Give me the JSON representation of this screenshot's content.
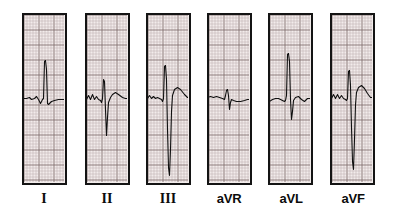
{
  "figure": {
    "background_color": "#ffffff",
    "width": 401,
    "height": 214
  },
  "grid": {
    "paper_color": "#f2eceb",
    "minor_line_color": "#b9aaa8",
    "major_line_color": "#7d6c6a",
    "border_color": "#141414",
    "minor_spacing_px": 3,
    "major_every": 5
  },
  "trace": {
    "color": "#101010",
    "line_width": 1.1,
    "baseline_y": 98
  },
  "chart_data": {
    "type": "line",
    "xlabel": "",
    "ylabel": "",
    "grid": true,
    "legend_position": "below-each-panel",
    "panel_count": 6,
    "panels": [
      {
        "label": "I",
        "label_style": "roman",
        "x": 22,
        "y": 13,
        "width": 45,
        "height": 172,
        "baseline_y": 98,
        "qrs": {
          "r_peak_y": 61,
          "r_amplitude_mm": 12.3,
          "s_depth_mm": 1.6,
          "description": "tall upright R wave, small s, flat baseline"
        },
        "points": "2,99 5,99 8,98 10,100 13,99 15,97 17,100 19,104 21,100 22,99 23,62 24,61 25,70 26,104 27,105 28,104 30,102 33,101 37,100 41,100 44,100"
      },
      {
        "label": "II",
        "label_style": "roman",
        "x": 85,
        "y": 13,
        "width": 45,
        "height": 172,
        "baseline_y": 98,
        "qrs": {
          "r_peak_y": 80,
          "r_amplitude_mm": 6.0,
          "s_depth_mm": 12.3,
          "description": "small R wave followed by deep S wave"
        },
        "points": "2,100 4,96 6,100 8,95 10,100 12,97 14,100 16,101 17,103 18,99 19,80 20,82 21,110 22,136 23,118 24,103 26,98 28,95 31,93 34,95 38,98 41,99 44,99"
      },
      {
        "label": "III",
        "label_style": "roman",
        "x": 146,
        "y": 13,
        "width": 45,
        "height": 172,
        "baseline_y": 98,
        "qrs": {
          "r_peak_y": 66,
          "r_amplitude_mm": 10.7,
          "s_depth_mm": 26.7,
          "description": "tall R wave then very deep S wave running off panel"
        },
        "points": "2,99 4,96 6,99 8,97 10,99 12,98 14,99 16,100 17,102 18,99 19,67 20,66 21,80 22,130 23,168 24,176 25,150 26,112 27,96 29,90 32,88 35,90 39,95 42,98 44,98"
      },
      {
        "label": "aVR",
        "label_style": "augmented",
        "x": 207,
        "y": 13,
        "width": 45,
        "height": 172,
        "baseline_y": 98,
        "qrs": {
          "r_peak_y": 90,
          "r_amplitude_mm": 2.7,
          "s_depth_mm": 4.0,
          "description": "small, nearly isoelectric complex, slight negative deflection"
        },
        "points": "1,98 4,97 7,98 10,97 13,98 16,99 18,100 19,96 20,91 21,90 22,96 23,110 24,103 25,100 27,101 30,102 34,102 38,101 41,100 44,100"
      },
      {
        "label": "aVL",
        "label_style": "augmented",
        "x": 268,
        "y": 13,
        "width": 45,
        "height": 172,
        "baseline_y": 98,
        "qrs": {
          "r_peak_y": 54,
          "r_amplitude_mm": 14.7,
          "s_depth_mm": 7.3,
          "description": "very tall narrow R wave with moderate S wave"
        },
        "points": "2,102 5,100 8,99 11,99 13,100 15,101 17,102 18,101 19,96 20,55 21,54 22,62 23,100 24,120 25,112 26,101 28,98 31,97 34,100 37,102 40,99 44,99"
      },
      {
        "label": "aVF",
        "label_style": "augmented",
        "x": 330,
        "y": 13,
        "width": 45,
        "height": 172,
        "baseline_y": 98,
        "qrs": {
          "r_peak_y": 71,
          "r_amplitude_mm": 9.0,
          "s_depth_mm": 24.0,
          "description": "R wave then very deep S wave running to bottom of panel"
        },
        "points": "2,99 4,95 6,99 8,95 10,99 12,96 14,99 16,100 17,101 18,99 19,72 20,71 21,86 22,128 23,162 24,170 25,140 26,105 27,93 29,88 32,86 35,89 38,94 41,98 44,98"
      }
    ]
  },
  "labels": [
    {
      "text": "I",
      "style": "roman",
      "center_x": 44,
      "y": 192
    },
    {
      "text": "II",
      "style": "roman",
      "center_x": 107,
      "y": 192
    },
    {
      "text": "III",
      "style": "roman",
      "center_x": 168,
      "y": 192
    },
    {
      "text": "aVR",
      "style": "augmented",
      "center_x": 229,
      "y": 192
    },
    {
      "text": "aVL",
      "style": "augmented",
      "center_x": 291,
      "y": 192
    },
    {
      "text": "aVF",
      "style": "augmented",
      "center_x": 353,
      "y": 192
    }
  ]
}
